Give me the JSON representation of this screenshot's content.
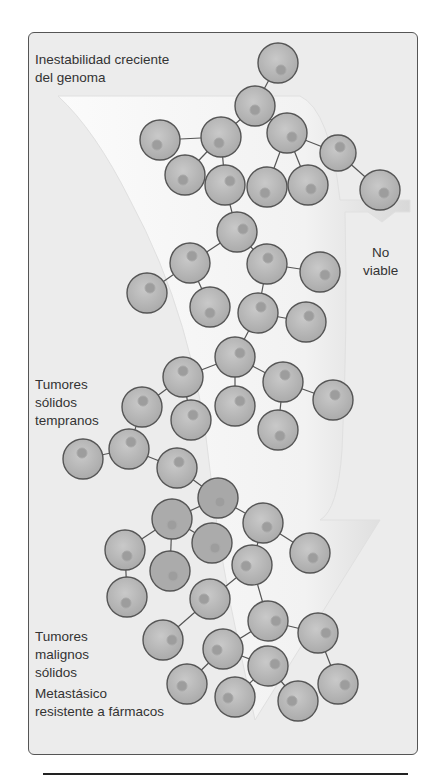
{
  "labels": {
    "top": "Inestabilidad creciente\ndel genoma",
    "not_viable": "No\nviable",
    "early": "Tumores\nsólidos\ntempranos",
    "malignant": "Tumores\nmalignos\nsólidos",
    "metastatic": "Metastásico\nresistente a fármacos"
  },
  "colors": {
    "background": "#ececec",
    "cell_fill": "#b8b8b8",
    "cell_stroke": "#555555",
    "nucleus": "#9a9a9a",
    "arrow": "#f7f7f7"
  }
}
